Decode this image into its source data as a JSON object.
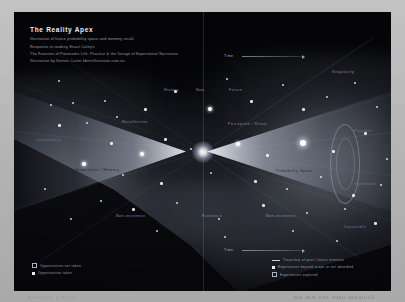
{
  "poster": {
    "title": "The Reality Apex",
    "subtitle_lines": [
      "Illustration of future probability space and memory recall.",
      "Response to reading Stuart Caley's",
      "The Features of Panoramic Life: Practice & the Design of Experiential Narratives",
      "Illustration by Kenton Carter  kbentillustrator.com.au"
    ]
  },
  "diagram": {
    "center_label": "Reality Apex",
    "labels": [
      {
        "text": "History",
        "x": 150,
        "y": 76,
        "tone": "dim"
      },
      {
        "text": "Now",
        "x": 182,
        "y": 76,
        "tone": "dim"
      },
      {
        "text": "Future",
        "x": 215,
        "y": 76,
        "tone": "dim"
      },
      {
        "text": "Singularity",
        "x": 318,
        "y": 58,
        "tone": "dim"
      },
      {
        "text": "Recollection",
        "x": 108,
        "y": 108,
        "tone": "dim"
      },
      {
        "text": "Perception / Ritual",
        "x": 214,
        "y": 110,
        "tone": "dim"
      },
      {
        "text": "Possible",
        "x": 340,
        "y": 117,
        "tone": "dark"
      },
      {
        "text": "Corporeality",
        "x": 22,
        "y": 126,
        "tone": "dark"
      },
      {
        "text": "Experience / Memory",
        "x": 62,
        "y": 156,
        "tone": "onlight"
      },
      {
        "text": "Probability Space",
        "x": 262,
        "y": 157,
        "tone": "onlight"
      },
      {
        "text": "Improbable",
        "x": 340,
        "y": 170,
        "tone": "dark"
      },
      {
        "text": "Non-existence",
        "x": 102,
        "y": 202,
        "tone": "dim"
      },
      {
        "text": "Existence",
        "x": 188,
        "y": 202,
        "tone": "dim"
      },
      {
        "text": "Non-existence",
        "x": 252,
        "y": 202,
        "tone": "dim"
      },
      {
        "text": "Impossible",
        "x": 330,
        "y": 213,
        "tone": "dark"
      }
    ],
    "axes": [
      {
        "label": "Time",
        "x": 228,
        "y": 44,
        "width": 62
      },
      {
        "label": "Time",
        "x": 228,
        "y": 238,
        "width": 62
      }
    ],
    "stars": [
      {
        "x": 44,
        "y": 68,
        "size": "sm"
      },
      {
        "x": 36,
        "y": 92,
        "size": "sm"
      },
      {
        "x": 58,
        "y": 90,
        "size": "sm"
      },
      {
        "x": 90,
        "y": 88,
        "size": "sm"
      },
      {
        "x": 44,
        "y": 112,
        "size": "md"
      },
      {
        "x": 72,
        "y": 110,
        "size": "sm"
      },
      {
        "x": 102,
        "y": 104,
        "size": "sm"
      },
      {
        "x": 130,
        "y": 96,
        "size": "md"
      },
      {
        "x": 160,
        "y": 78,
        "size": "md"
      },
      {
        "x": 194,
        "y": 95,
        "size": "lg"
      },
      {
        "x": 212,
        "y": 66,
        "size": "sm"
      },
      {
        "x": 236,
        "y": 88,
        "size": "md"
      },
      {
        "x": 268,
        "y": 72,
        "size": "sm"
      },
      {
        "x": 288,
        "y": 96,
        "size": "md"
      },
      {
        "x": 312,
        "y": 84,
        "size": "sm"
      },
      {
        "x": 340,
        "y": 70,
        "size": "sm"
      },
      {
        "x": 362,
        "y": 94,
        "size": "sm"
      },
      {
        "x": 96,
        "y": 130,
        "size": "md"
      },
      {
        "x": 126,
        "y": 140,
        "size": "lg"
      },
      {
        "x": 150,
        "y": 126,
        "size": "md"
      },
      {
        "x": 176,
        "y": 136,
        "size": "sm"
      },
      {
        "x": 222,
        "y": 130,
        "size": "lg"
      },
      {
        "x": 252,
        "y": 142,
        "size": "md"
      },
      {
        "x": 286,
        "y": 128,
        "size": "xl"
      },
      {
        "x": 318,
        "y": 138,
        "size": "md"
      },
      {
        "x": 350,
        "y": 120,
        "size": "md"
      },
      {
        "x": 372,
        "y": 146,
        "size": "sm"
      },
      {
        "x": 68,
        "y": 150,
        "size": "lg"
      },
      {
        "x": 108,
        "y": 162,
        "size": "sm"
      },
      {
        "x": 146,
        "y": 170,
        "size": "md"
      },
      {
        "x": 196,
        "y": 160,
        "size": "sm"
      },
      {
        "x": 240,
        "y": 168,
        "size": "md"
      },
      {
        "x": 272,
        "y": 176,
        "size": "sm"
      },
      {
        "x": 306,
        "y": 164,
        "size": "sm"
      },
      {
        "x": 338,
        "y": 182,
        "size": "md"
      },
      {
        "x": 366,
        "y": 172,
        "size": "sm"
      },
      {
        "x": 86,
        "y": 188,
        "size": "sm"
      },
      {
        "x": 118,
        "y": 196,
        "size": "md"
      },
      {
        "x": 162,
        "y": 190,
        "size": "sm"
      },
      {
        "x": 204,
        "y": 206,
        "size": "sm"
      },
      {
        "x": 248,
        "y": 192,
        "size": "md"
      },
      {
        "x": 292,
        "y": 200,
        "size": "sm"
      },
      {
        "x": 330,
        "y": 196,
        "size": "sm"
      },
      {
        "x": 360,
        "y": 210,
        "size": "md"
      },
      {
        "x": 142,
        "y": 218,
        "size": "sm"
      },
      {
        "x": 210,
        "y": 224,
        "size": "sm"
      },
      {
        "x": 278,
        "y": 218,
        "size": "sm"
      },
      {
        "x": 322,
        "y": 228,
        "size": "sm"
      },
      {
        "x": 56,
        "y": 206,
        "size": "sm"
      },
      {
        "x": 30,
        "y": 176,
        "size": "sm"
      }
    ]
  },
  "legend_left": {
    "items": [
      {
        "marker": "square-hollow",
        "text": "Opportunities not taken"
      },
      {
        "marker": "square-solid",
        "text": "Opportunities taken"
      }
    ]
  },
  "legend_right": {
    "items": [
      {
        "marker": "line",
        "text": "Trajectory of past / future interests"
      },
      {
        "marker": "square-solid",
        "text": "Experiences beyond scope or not absorbed"
      },
      {
        "marker": "square-hollow",
        "text": "Experiences explored"
      }
    ]
  },
  "reflection": {
    "left": "Kenton Carter",
    "right": "we are our own memory"
  },
  "colors": {
    "plate_bg": "#050507",
    "accent_text": "#e9edf4",
    "muted_text": "#9aa3b4",
    "paper": "#b8b8b8"
  }
}
